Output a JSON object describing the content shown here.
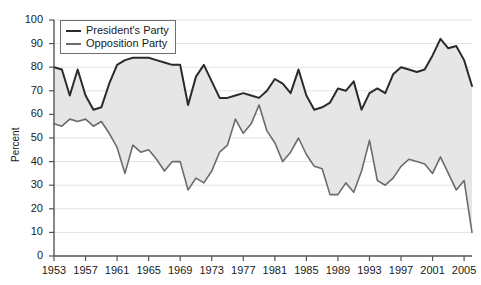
{
  "chart_data": {
    "type": "line",
    "title": "",
    "xlabel": "",
    "ylabel": "Percent",
    "ylim": [
      0,
      100
    ],
    "ytick_values": [
      0,
      10,
      20,
      30,
      40,
      50,
      60,
      70,
      80,
      90,
      100
    ],
    "ytick_labels": [
      "0",
      "10",
      "20",
      "30",
      "40",
      "50",
      "60",
      "70",
      "80",
      "90",
      "100"
    ],
    "xlim": [
      1953,
      2006
    ],
    "xtick_values": [
      1953,
      1957,
      1961,
      1965,
      1969,
      1973,
      1977,
      1981,
      1985,
      1989,
      1993,
      1997,
      2001,
      2005
    ],
    "xtick_labels": [
      "1953",
      "1957",
      "1961",
      "1965",
      "1969",
      "1973",
      "1977",
      "1981",
      "1985",
      "1989",
      "1993",
      "1997",
      "2001",
      "2005"
    ],
    "grid": "horizontal",
    "legend_position": "top-left",
    "fill_between": true,
    "fill_color": "#e6e6e6",
    "x": [
      1953,
      1954,
      1955,
      1956,
      1957,
      1958,
      1959,
      1960,
      1961,
      1962,
      1963,
      1964,
      1965,
      1966,
      1967,
      1968,
      1969,
      1970,
      1971,
      1972,
      1973,
      1974,
      1975,
      1976,
      1977,
      1978,
      1979,
      1980,
      1981,
      1982,
      1983,
      1984,
      1985,
      1986,
      1987,
      1988,
      1989,
      1990,
      1991,
      1992,
      1993,
      1994,
      1995,
      1996,
      1997,
      1998,
      1999,
      2000,
      2001,
      2002,
      2003,
      2004,
      2005,
      2006
    ],
    "series": [
      {
        "name": "President's Party",
        "color": "#2b2b2b",
        "line_width": 2,
        "values": [
          80,
          79,
          68,
          79,
          68,
          62,
          63,
          73,
          81,
          83,
          84,
          84,
          84,
          83,
          82,
          81,
          81,
          64,
          76,
          81,
          74,
          67,
          67,
          68,
          69,
          68,
          67,
          70,
          75,
          73,
          69,
          79,
          68,
          62,
          63,
          65,
          71,
          70,
          74,
          62,
          69,
          71,
          69,
          77,
          80,
          79,
          78,
          79,
          85,
          92,
          88,
          89,
          83,
          72
        ]
      },
      {
        "name": "Opposition Party",
        "color": "#6b6b6b",
        "line_width": 1.6,
        "values": [
          56,
          55,
          58,
          57,
          58,
          55,
          57,
          52,
          46,
          35,
          47,
          44,
          45,
          41,
          36,
          40,
          40,
          28,
          33,
          31,
          36,
          44,
          47,
          58,
          52,
          56,
          64,
          53,
          48,
          40,
          44,
          50,
          43,
          38,
          37,
          26,
          26,
          31,
          27,
          36,
          49,
          32,
          30,
          33,
          38,
          41,
          40,
          39,
          35,
          42,
          35,
          28,
          32,
          10
        ]
      }
    ]
  },
  "legend": {
    "entries": [
      {
        "label": "President's Party"
      },
      {
        "label": "Opposition Party"
      }
    ]
  }
}
